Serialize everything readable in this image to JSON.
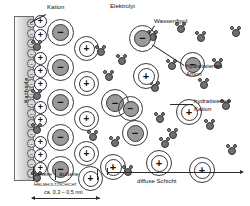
{
  "diagram": {
    "language": "de",
    "background": "#ffffff",
    "colors": {
      "electrode_fill": "#d2d2d2",
      "electrode_border": "#6d6d6d",
      "anion_core": "#9a9a9a",
      "cation_core": "#ffffff",
      "dipole_fill": "#707070",
      "outline": "#2e2e2e",
      "text": "#111111"
    }
  },
  "labels": {
    "electrode": "Kathode",
    "kation": "Kation",
    "elektrolyt": "Elektrolyt",
    "wasserdipol": "Wasserdipol",
    "hydratisiertes_anion": "hydratisiertes\nAnion",
    "hydratisiertes_kation": "hydratisiertes\nKation",
    "innere": "innere",
    "aeussere": "äußere",
    "helmholtzschicht": "Helmholtzschicht",
    "dimension": "ca. 0,3 – 0,5 nm",
    "diffuse_schicht": "diffuse Schicht"
  },
  "symbols": {
    "plus": "+",
    "minus": "−"
  },
  "surface_charges": [
    {
      "x": 27,
      "y": 19,
      "sign": "−"
    },
    {
      "x": 27,
      "y": 29,
      "sign": "−"
    },
    {
      "x": 27,
      "y": 39,
      "sign": "−"
    },
    {
      "x": 27,
      "y": 49,
      "sign": "−"
    },
    {
      "x": 27,
      "y": 59,
      "sign": "−"
    },
    {
      "x": 27,
      "y": 69,
      "sign": "−"
    },
    {
      "x": 27,
      "y": 79,
      "sign": "−"
    },
    {
      "x": 27,
      "y": 89,
      "sign": "−"
    },
    {
      "x": 27,
      "y": 99,
      "sign": "−"
    },
    {
      "x": 27,
      "y": 109,
      "sign": "−"
    },
    {
      "x": 27,
      "y": 119,
      "sign": "−"
    },
    {
      "x": 27,
      "y": 129,
      "sign": "−"
    },
    {
      "x": 27,
      "y": 139,
      "sign": "−"
    },
    {
      "x": 27,
      "y": 149,
      "sign": "−"
    },
    {
      "x": 27,
      "y": 159,
      "sign": "−"
    },
    {
      "x": 27,
      "y": 169,
      "sign": "−"
    }
  ],
  "adsorbed_cations": [
    {
      "x": 34,
      "y": 15,
      "sign": "+"
    },
    {
      "x": 34,
      "y": 29,
      "sign": "+"
    },
    {
      "x": 34,
      "y": 52,
      "sign": "+"
    },
    {
      "x": 34,
      "y": 65,
      "sign": "+"
    },
    {
      "x": 34,
      "y": 78,
      "sign": "+"
    },
    {
      "x": 34,
      "y": 101,
      "sign": "+"
    },
    {
      "x": 34,
      "y": 114,
      "sign": "+"
    },
    {
      "x": 34,
      "y": 136,
      "sign": "+"
    },
    {
      "x": 34,
      "y": 149,
      "sign": "+"
    },
    {
      "x": 34,
      "y": 162,
      "sign": "+"
    }
  ],
  "adsorbed_dipoles": [
    {
      "x": 32,
      "y": 41
    },
    {
      "x": 32,
      "y": 90
    },
    {
      "x": 32,
      "y": 124
    },
    {
      "x": 32,
      "y": 172
    }
  ],
  "hydrated_ions": [
    {
      "x": 47,
      "y": 19,
      "d": 27,
      "core": 17,
      "sign": "−",
      "type": "anion"
    },
    {
      "x": 47,
      "y": 54,
      "d": 27,
      "core": 17,
      "sign": "−",
      "type": "anion"
    },
    {
      "x": 47,
      "y": 89,
      "d": 27,
      "core": 17,
      "sign": "−",
      "type": "anion"
    },
    {
      "x": 47,
      "y": 124,
      "d": 27,
      "core": 17,
      "sign": "−",
      "type": "anion"
    },
    {
      "x": 47,
      "y": 156,
      "d": 27,
      "core": 17,
      "sign": "−",
      "type": "anion"
    },
    {
      "x": 74,
      "y": 36,
      "d": 25,
      "core": 16,
      "sign": "+",
      "type": "cation"
    },
    {
      "x": 74,
      "y": 71,
      "d": 25,
      "core": 16,
      "sign": "+",
      "type": "cation"
    },
    {
      "x": 74,
      "y": 106,
      "d": 25,
      "core": 16,
      "sign": "+",
      "type": "cation"
    },
    {
      "x": 74,
      "y": 141,
      "d": 25,
      "core": 16,
      "sign": "+",
      "type": "cation"
    },
    {
      "x": 78,
      "y": 166,
      "d": 25,
      "core": 16,
      "sign": "+",
      "type": "cation"
    },
    {
      "x": 101,
      "y": 89,
      "d": 28,
      "core": 18,
      "sign": "−",
      "type": "anion"
    },
    {
      "x": 100,
      "y": 154,
      "d": 26,
      "core": 17,
      "sign": "+",
      "type": "cation"
    },
    {
      "x": 129,
      "y": 25,
      "d": 27,
      "core": 17,
      "sign": "−",
      "type": "anion"
    },
    {
      "x": 133,
      "y": 63,
      "d": 26,
      "core": 17,
      "sign": "+",
      "type": "cation"
    },
    {
      "x": 122,
      "y": 120,
      "d": 26,
      "core": 17,
      "sign": "−",
      "type": "anion"
    },
    {
      "x": 146,
      "y": 150,
      "d": 26,
      "core": 17,
      "sign": "+",
      "type": "cation"
    },
    {
      "x": 118,
      "y": 96,
      "d": 25,
      "core": 16,
      "sign": "−",
      "type": "anion"
    },
    {
      "x": 176,
      "y": 99,
      "d": 26,
      "core": 17,
      "sign": "+",
      "type": "cation"
    },
    {
      "x": 180,
      "y": 52,
      "d": 25,
      "core": 16,
      "sign": "−",
      "type": "anion"
    },
    {
      "x": 189,
      "y": 157,
      "d": 26,
      "core": 17,
      "sign": "+",
      "type": "cation"
    }
  ],
  "water_dipoles": [
    {
      "x": 96,
      "y": 46
    },
    {
      "x": 104,
      "y": 71
    },
    {
      "x": 88,
      "y": 131
    },
    {
      "x": 110,
      "y": 137
    },
    {
      "x": 117,
      "y": 55
    },
    {
      "x": 123,
      "y": 166
    },
    {
      "x": 148,
      "y": 31
    },
    {
      "x": 150,
      "y": 82
    },
    {
      "x": 155,
      "y": 113
    },
    {
      "x": 160,
      "y": 138
    },
    {
      "x": 167,
      "y": 60
    },
    {
      "x": 176,
      "y": 23
    },
    {
      "x": 168,
      "y": 129
    },
    {
      "x": 196,
      "y": 32
    },
    {
      "x": 199,
      "y": 79
    },
    {
      "x": 205,
      "y": 120
    },
    {
      "x": 213,
      "y": 59
    },
    {
      "x": 221,
      "y": 100
    },
    {
      "x": 231,
      "y": 27
    },
    {
      "x": 227,
      "y": 145
    }
  ]
}
